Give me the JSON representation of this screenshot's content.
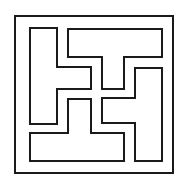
{
  "diagram": {
    "type": "tiling-puzzle",
    "stroke_color": "#1a1a1a",
    "background_color": "#ffffff",
    "frame": {
      "x1": 15,
      "y1": 16,
      "x2": 173,
      "y2": 173
    },
    "pieces": [
      {
        "name": "top-t-piece",
        "points": "68,29 162,29 162,57 124,57 124,89 102,89 102,57 68,57"
      },
      {
        "name": "left-t-piece",
        "points": "30,28 57,28 57,67 91,67 91,89 57,89 57,124 30,124"
      },
      {
        "name": "right-t-piece",
        "points": "135,68 162,68 162,161 135,161 135,123 102,123 102,98 135,98"
      },
      {
        "name": "bottom-t-piece",
        "points": "68,99 91,99 91,133 124,133 124,161 30,161 30,133 68,133"
      }
    ]
  }
}
